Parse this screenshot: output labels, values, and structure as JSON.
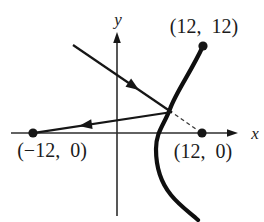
{
  "figure": {
    "background_color": "#ffffff",
    "ink_color": "#161616",
    "description_kind": "hyperbola-reflection-diagram"
  },
  "axes": {
    "x_label": "x",
    "y_label": "y"
  },
  "points": {
    "curve_top": {
      "label": "(12,  12)",
      "x": 12,
      "y": 12
    },
    "left_focus": {
      "label": "(−12,  0)",
      "x": -12,
      "y": 0
    },
    "right_focus": {
      "label": "(12,  0)",
      "x": 12,
      "y": 0
    }
  }
}
